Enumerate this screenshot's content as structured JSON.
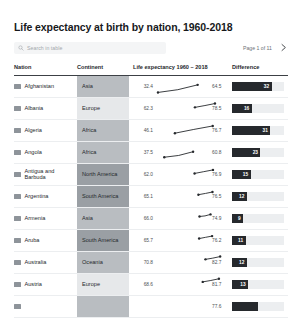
{
  "header": {
    "title": "Life expectancy at birth by nation, 1960-2018",
    "search_placeholder": "Search in table",
    "page_label": "Page 1 of 11"
  },
  "columns": {
    "nation": "Nation",
    "continent": "Continent",
    "spark": "Life expectancy 1960 – 2018",
    "difference": "Difference"
  },
  "scale": {
    "value_min": 30,
    "value_max": 85,
    "diff_max": 42
  },
  "colors": {
    "bar": "#26292d",
    "track": "#eceef0",
    "continent_strong": "#9a9fa4",
    "continent_mid": "#b9bdc1",
    "continent_light": "#e6e8ea",
    "line": "#26292d"
  },
  "rows": [
    {
      "nation": "Afghanistan",
      "continent": "Asia",
      "cont_shade": "mid",
      "flag": "flag-af",
      "start": 32.4,
      "end": 64.5,
      "diff": 32,
      "mid": 44.0
    },
    {
      "nation": "Albania",
      "continent": "Europe",
      "cont_shade": "light",
      "flag": "flag-al",
      "start": 62.3,
      "end": 78.5,
      "diff": 16,
      "mid": 70.0
    },
    {
      "nation": "Algeria",
      "continent": "Africa",
      "cont_shade": "mid",
      "flag": "flag-dz",
      "start": 46.1,
      "end": 76.7,
      "diff": 31,
      "mid": 62.0
    },
    {
      "nation": "Angola",
      "continent": "Africa",
      "cont_shade": "mid",
      "flag": "flag-ao",
      "start": 37.5,
      "end": 60.8,
      "diff": 23,
      "mid": 45.0
    },
    {
      "nation": "Antigua and Barbuda",
      "continent": "North America",
      "cont_shade": "strong",
      "flag": "flag-ag",
      "start": 62.0,
      "end": 76.9,
      "diff": 15,
      "mid": 69.5
    },
    {
      "nation": "Argentina",
      "continent": "South America",
      "cont_shade": "strong",
      "flag": "flag-ar",
      "start": 65.1,
      "end": 76.5,
      "diff": 12,
      "mid": 70.5
    },
    {
      "nation": "Armenia",
      "continent": "Asia",
      "cont_shade": "mid",
      "flag": "flag-am",
      "start": 66.0,
      "end": 74.9,
      "diff": 9,
      "mid": 68.5
    },
    {
      "nation": "Aruba",
      "continent": "South America",
      "cont_shade": "strong",
      "flag": "flag-aw",
      "start": 65.7,
      "end": 76.2,
      "diff": 11,
      "mid": 71.0
    },
    {
      "nation": "Australia",
      "continent": "Oceania",
      "cont_shade": "mid",
      "flag": "flag-au",
      "start": 70.8,
      "end": 82.7,
      "diff": 12,
      "mid": 76.0
    },
    {
      "nation": "Austria",
      "continent": "Europe",
      "cont_shade": "light",
      "flag": "flag-at",
      "start": 68.6,
      "end": 81.7,
      "diff": 13,
      "mid": 74.5
    },
    {
      "nation": "",
      "continent": "",
      "cont_shade": "mid",
      "flag": "flag-az",
      "start": null,
      "end": 77.6,
      "diff": null,
      "mid": null
    }
  ]
}
